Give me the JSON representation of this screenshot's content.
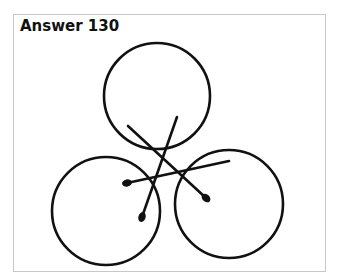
{
  "title": "Answer 130",
  "colors": {
    "stroke": "#111111",
    "frame": "#c8c8c8",
    "background": "#ffffff"
  },
  "circles": [
    {
      "name": "top",
      "cx": 157,
      "cy": 96,
      "r": 53
    },
    {
      "name": "bottom-left",
      "cx": 106,
      "cy": 211,
      "r": 54
    },
    {
      "name": "bottom-right",
      "cx": 229,
      "cy": 204,
      "r": 54
    }
  ],
  "matches": [
    {
      "name": "match-a",
      "x1": 128,
      "y1": 126,
      "x2": 206,
      "y2": 198
    },
    {
      "name": "match-b",
      "x1": 177,
      "y1": 117,
      "x2": 142,
      "y2": 217
    },
    {
      "name": "match-c",
      "x1": 229,
      "y1": 161,
      "x2": 127,
      "y2": 183
    }
  ]
}
